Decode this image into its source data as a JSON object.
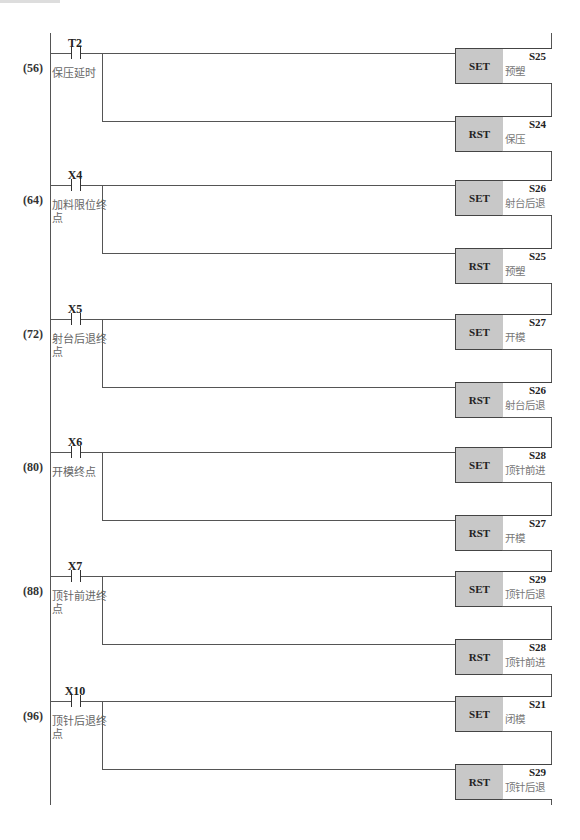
{
  "diagram": {
    "type": "ladder",
    "rungs": [
      {
        "step": "(56)",
        "contact": {
          "device": "T2",
          "comment": "保压延时"
        },
        "outputs": [
          {
            "instr": "SET",
            "device": "S25",
            "comment": "预塑"
          },
          {
            "instr": "RST",
            "device": "S24",
            "comment": "保压"
          }
        ]
      },
      {
        "step": "(64)",
        "contact": {
          "device": "X4",
          "comment": "加料限位终点"
        },
        "outputs": [
          {
            "instr": "SET",
            "device": "S26",
            "comment": "射台后退"
          },
          {
            "instr": "RST",
            "device": "S25",
            "comment": "预塑"
          }
        ]
      },
      {
        "step": "(72)",
        "contact": {
          "device": "X5",
          "comment": "射台后退终点"
        },
        "outputs": [
          {
            "instr": "SET",
            "device": "S27",
            "comment": "开模"
          },
          {
            "instr": "RST",
            "device": "S26",
            "comment": "射台后退"
          }
        ]
      },
      {
        "step": "(80)",
        "contact": {
          "device": "X6",
          "comment": "开模终点"
        },
        "outputs": [
          {
            "instr": "SET",
            "device": "S28",
            "comment": "顶针前进"
          },
          {
            "instr": "RST",
            "device": "S27",
            "comment": "开模"
          }
        ]
      },
      {
        "step": "(88)",
        "contact": {
          "device": "X7",
          "comment": "顶针前进终点"
        },
        "outputs": [
          {
            "instr": "SET",
            "device": "S29",
            "comment": "顶针后退"
          },
          {
            "instr": "RST",
            "device": "S28",
            "comment": "顶针前进"
          }
        ]
      },
      {
        "step": "(96)",
        "contact": {
          "device": "X10",
          "comment": "顶针后退终点"
        },
        "outputs": [
          {
            "instr": "SET",
            "device": "S21",
            "comment": "闭模"
          },
          {
            "instr": "RST",
            "device": "S29",
            "comment": "顶针后退"
          }
        ]
      }
    ]
  }
}
